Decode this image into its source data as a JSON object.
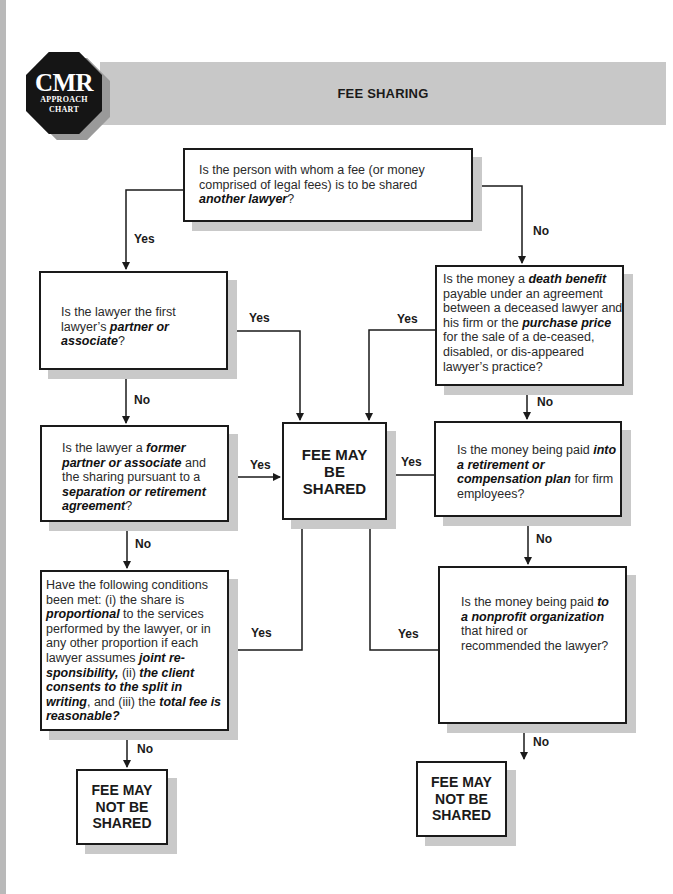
{
  "header": {
    "logo": {
      "main": "CMR",
      "sub1": "APPROACH",
      "sub2": "CHART"
    },
    "title": "FEE SHARING"
  },
  "nodes": {
    "q_another_lawyer": {
      "parts": [
        {
          "text": "Is the person with whom a fee (or money comprised of legal fees) is to be shared ",
          "em": false
        },
        {
          "text": "another lawyer",
          "em": true
        },
        {
          "text": "?",
          "em": false
        }
      ]
    },
    "q_partner": {
      "parts": [
        {
          "text": "Is the lawyer the first lawyer’s ",
          "em": false
        },
        {
          "text": "partner or associate",
          "em": true
        },
        {
          "text": "?",
          "em": false
        }
      ]
    },
    "q_former_partner": {
      "parts": [
        {
          "text": "Is the lawyer a ",
          "em": false
        },
        {
          "text": "former partner or associate",
          "em": true
        },
        {
          "text": " and the sharing pursuant to a ",
          "em": false
        },
        {
          "text": "separation or retirement agreement",
          "em": true
        },
        {
          "text": "?",
          "em": false
        }
      ]
    },
    "q_conditions": {
      "parts": [
        {
          "text": "Have the following conditions been met: (i) the share is ",
          "em": false
        },
        {
          "text": "proportional",
          "em": true
        },
        {
          "text": " to the services performed by the lawyer, or in any other proportion if each lawyer assumes ",
          "em": false
        },
        {
          "text": "joint re-sponsibility,",
          "em": true
        },
        {
          "text": " (ii) ",
          "em": false
        },
        {
          "text": "the client consents to the split in writing",
          "em": true
        },
        {
          "text": ", and (iii)  the ",
          "em": false
        },
        {
          "text": "total fee is reasonable?",
          "em": true
        }
      ]
    },
    "q_death_benefit": {
      "parts": [
        {
          "text": "Is the money a ",
          "em": false
        },
        {
          "text": "death benefit",
          "em": true
        },
        {
          "text": " payable under an agreement between a deceased lawyer and his firm or the ",
          "em": false
        },
        {
          "text": "purchase price",
          "em": true
        },
        {
          "text": " for the sale of a de-ceased, disabled, or dis-appeared lawyer’s practice?",
          "em": false
        }
      ]
    },
    "q_retirement_plan": {
      "parts": [
        {
          "text": "Is the money being paid ",
          "em": false
        },
        {
          "text": "into a retirement or compensation plan",
          "em": true
        },
        {
          "text": " for firm employees?",
          "em": false
        }
      ]
    },
    "q_nonprofit": {
      "parts": [
        {
          "text": "Is the money being paid ",
          "em": false
        },
        {
          "text": "to a nonprofit organization",
          "em": true
        },
        {
          "text": " that hired or recommended the lawyer?",
          "em": false
        }
      ]
    },
    "t_may_be_shared": {
      "line1": "FEE MAY",
      "line2": "BE",
      "line3": "SHARED"
    },
    "t_not_shared_left": {
      "line1": "FEE MAY",
      "line2": "NOT BE",
      "line3": "SHARED"
    },
    "t_not_shared_right": {
      "line1": "FEE MAY",
      "line2": "NOT BE",
      "line3": "SHARED"
    }
  },
  "edge_labels": {
    "top_yes": "Yes",
    "top_no": "No",
    "partner_yes": "Yes",
    "partner_no": "No",
    "former_yes": "Yes",
    "former_no": "No",
    "conditions_yes": "Yes",
    "conditions_no": "No",
    "death_yes": "Yes",
    "death_no": "No",
    "retire_yes": "Yes",
    "retire_no": "No",
    "nonprofit_yes": "Yes",
    "nonprofit_no": "No"
  },
  "edges": [
    {
      "from": "q_another_lawyer",
      "to": "q_partner",
      "label": "Yes"
    },
    {
      "from": "q_another_lawyer",
      "to": "q_death_benefit",
      "label": "No"
    },
    {
      "from": "q_partner",
      "to": "t_may_be_shared",
      "label": "Yes"
    },
    {
      "from": "q_partner",
      "to": "q_former_partner",
      "label": "No"
    },
    {
      "from": "q_former_partner",
      "to": "t_may_be_shared",
      "label": "Yes"
    },
    {
      "from": "q_former_partner",
      "to": "q_conditions",
      "label": "No"
    },
    {
      "from": "q_conditions",
      "to": "t_may_be_shared",
      "label": "Yes"
    },
    {
      "from": "q_conditions",
      "to": "t_not_shared_left",
      "label": "No"
    },
    {
      "from": "q_death_benefit",
      "to": "t_may_be_shared",
      "label": "Yes"
    },
    {
      "from": "q_death_benefit",
      "to": "q_retirement_plan",
      "label": "No"
    },
    {
      "from": "q_retirement_plan",
      "to": "t_may_be_shared",
      "label": "Yes"
    },
    {
      "from": "q_retirement_plan",
      "to": "q_nonprofit",
      "label": "No"
    },
    {
      "from": "q_nonprofit",
      "to": "t_may_be_shared",
      "label": "Yes"
    },
    {
      "from": "q_nonprofit",
      "to": "t_not_shared_right",
      "label": "No"
    }
  ]
}
